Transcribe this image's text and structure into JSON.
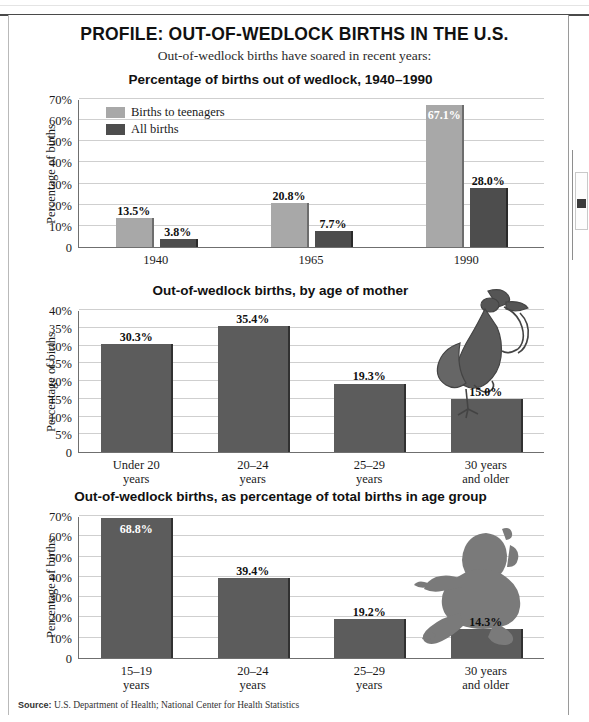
{
  "header": {
    "title": "PROFILE: OUT-OF-WEDLOCK BIRTHS IN THE U.S.",
    "subtitle": "Out-of-wedlock births have soared in recent years:"
  },
  "source": {
    "label": "Source:",
    "text": "U.S. Department of Health; National Center for Health Statistics"
  },
  "colors": {
    "light_bar": "#a8a8a8",
    "dark_bar": "#4d4d4d",
    "mid_bar": "#5c5c5c",
    "gridline": "#cfcfcf",
    "axis": "#6f6f6f",
    "text": "#1a1a1a"
  },
  "chart_data": [
    {
      "type": "bar",
      "title": "Percentage of births out of wedlock, 1940–1990",
      "xlabel": "",
      "ylabel": "Percentage of births",
      "categories": [
        "1940",
        "1965",
        "1990"
      ],
      "ylim": [
        0,
        70
      ],
      "yticks": [
        "0",
        "10%",
        "20%",
        "30%",
        "40%",
        "50%",
        "60%",
        "70%"
      ],
      "ytick_values": [
        0,
        10,
        20,
        30,
        40,
        50,
        60,
        70
      ],
      "grid": true,
      "legend": "inside-top-left",
      "series": [
        {
          "name": "Births to teenagers",
          "color": "#a8a8a8",
          "values": [
            13.5,
            20.8,
            67.1
          ],
          "labels": [
            "13.5%",
            "20.8%",
            "67.1%"
          ],
          "label_inside": [
            false,
            false,
            true
          ]
        },
        {
          "name": "All births",
          "color": "#4d4d4d",
          "values": [
            3.8,
            7.7,
            28.0
          ],
          "labels": [
            "3.8%",
            "7.7%",
            "28.0%"
          ],
          "label_inside": [
            false,
            false,
            false
          ]
        }
      ]
    },
    {
      "type": "bar",
      "title": "Out-of-wedlock births, by age of mother",
      "xlabel": "",
      "ylabel": "Percentage of births",
      "categories": [
        "Under 20\nyears",
        "20–24\nyears",
        "25–29\nyears",
        "30 years\nand older"
      ],
      "category_lines": [
        [
          "Under 20",
          "years"
        ],
        [
          "20–24",
          "years"
        ],
        [
          "25–29",
          "years"
        ],
        [
          "30 years",
          "and older"
        ]
      ],
      "ylim": [
        0,
        40
      ],
      "yticks": [
        "0",
        "5%",
        "10%",
        "15%",
        "20%",
        "25%",
        "30%",
        "35%",
        "40%"
      ],
      "ytick_values": [
        0,
        5,
        10,
        15,
        20,
        25,
        30,
        35,
        40
      ],
      "grid": true,
      "illustration": "stork-with-bundle-icon",
      "series": [
        {
          "name": "Out-of-wedlock births",
          "color": "#5c5c5c",
          "values": [
            30.3,
            35.4,
            19.3,
            15.0
          ],
          "labels": [
            "30.3%",
            "35.4%",
            "19.3%",
            "15.0%"
          ],
          "label_inside": [
            false,
            false,
            false,
            false
          ]
        }
      ]
    },
    {
      "type": "bar",
      "title": "Out-of-wedlock births, as percentage of total births in age group",
      "xlabel": "",
      "ylabel": "Percentage of births",
      "categories": [
        "15–19\nyears",
        "20–24\nyears",
        "25–29\nyears",
        "30 years\nand older"
      ],
      "category_lines": [
        [
          "15–19",
          "years"
        ],
        [
          "20–24",
          "years"
        ],
        [
          "25–29",
          "years"
        ],
        [
          "30 years",
          "and older"
        ]
      ],
      "ylim": [
        0,
        70
      ],
      "yticks": [
        "0",
        "10%",
        "20%",
        "30%",
        "40%",
        "50%",
        "60%",
        "70%"
      ],
      "ytick_values": [
        0,
        10,
        20,
        30,
        40,
        50,
        60,
        70
      ],
      "grid": true,
      "illustration": "sitting-baby-icon",
      "series": [
        {
          "name": "Out-of-wedlock births",
          "color": "#5c5c5c",
          "values": [
            68.8,
            39.4,
            19.2,
            14.3
          ],
          "labels": [
            "68.8%",
            "39.4%",
            "19.2%",
            "14.3%"
          ],
          "label_inside": [
            true,
            false,
            false,
            false
          ]
        }
      ]
    }
  ]
}
